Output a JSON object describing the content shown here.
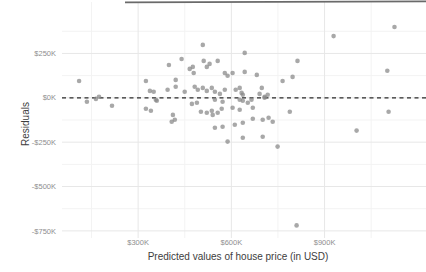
{
  "chart_data": {
    "type": "scatter",
    "title": "",
    "xlabel": "Predicted values of house price (in USD)",
    "ylabel": "Residuals",
    "units": "values in thousands of USD (K)",
    "xlim": [
      55,
      1220
    ],
    "ylim": [
      -790,
      540
    ],
    "grid": true,
    "legend": false,
    "x_ticks": [
      {
        "value": 300,
        "label": "$300K"
      },
      {
        "value": 600,
        "label": "$600K"
      },
      {
        "value": 900,
        "label": "$900K"
      }
    ],
    "y_ticks": [
      {
        "value": 250,
        "label": "$250K"
      },
      {
        "value": 0,
        "label": "$0K"
      },
      {
        "value": -250,
        "label": "-$250K"
      },
      {
        "value": -500,
        "label": "-$500K"
      },
      {
        "value": -750,
        "label": "-$750K"
      }
    ],
    "x_minor_gridlines": [
      150,
      450,
      750,
      1050
    ],
    "y_minor_gridlines": [
      375,
      125,
      -125,
      -375,
      -625
    ],
    "reference_line": {
      "y": 0,
      "style": "dashed"
    },
    "colors": {
      "point": "#878787",
      "grid_major": "#e7e7e7",
      "grid_minor": "#f3f3f3",
      "reference_line": "#2b2b2b",
      "tick_label": "#8e8e8e",
      "axis_title": "#3d3d3d",
      "top_border": "#6a6a6a",
      "background": "#ffffff"
    },
    "points": [
      [
        110,
        95
      ],
      [
        135,
        -22
      ],
      [
        164,
        -6
      ],
      [
        174,
        6
      ],
      [
        216,
        -45
      ],
      [
        325,
        95
      ],
      [
        338,
        39
      ],
      [
        350,
        34
      ],
      [
        360,
        -17
      ],
      [
        325,
        -62
      ],
      [
        341,
        -73
      ],
      [
        357,
        -11
      ],
      [
        395,
        45
      ],
      [
        399,
        185
      ],
      [
        412,
        -96
      ],
      [
        418,
        -124
      ],
      [
        408,
        -135
      ],
      [
        421,
        101
      ],
      [
        421,
        62
      ],
      [
        440,
        219
      ],
      [
        466,
        163
      ],
      [
        476,
        174
      ],
      [
        479,
        140
      ],
      [
        511,
        208
      ],
      [
        521,
        174
      ],
      [
        530,
        191
      ],
      [
        556,
        208
      ],
      [
        508,
        298
      ],
      [
        579,
        140
      ],
      [
        588,
        124
      ],
      [
        604,
        140
      ],
      [
        450,
        34
      ],
      [
        482,
        62
      ],
      [
        492,
        45
      ],
      [
        508,
        56
      ],
      [
        521,
        39
      ],
      [
        537,
        56
      ],
      [
        547,
        34
      ],
      [
        563,
        22
      ],
      [
        579,
        45
      ],
      [
        614,
        45
      ],
      [
        627,
        56
      ],
      [
        633,
        28
      ],
      [
        637,
        17
      ],
      [
        547,
        -11
      ],
      [
        572,
        -22
      ],
      [
        473,
        -34
      ],
      [
        489,
        -28
      ],
      [
        502,
        -79
      ],
      [
        521,
        -84
      ],
      [
        537,
        -73
      ],
      [
        540,
        -96
      ],
      [
        556,
        -84
      ],
      [
        569,
        -62
      ],
      [
        604,
        -56
      ],
      [
        627,
        -67
      ],
      [
        547,
        -169
      ],
      [
        572,
        -163
      ],
      [
        611,
        -152
      ],
      [
        637,
        -140
      ],
      [
        588,
        -247
      ],
      [
        637,
        -225
      ],
      [
        701,
        -219
      ],
      [
        749,
        -275
      ],
      [
        643,
        253
      ],
      [
        643,
        146
      ],
      [
        682,
        129
      ],
      [
        669,
        -56
      ],
      [
        665,
        -11
      ],
      [
        637,
        -17
      ],
      [
        653,
        -28
      ],
      [
        691,
        22
      ],
      [
        707,
        6
      ],
      [
        698,
        56
      ],
      [
        717,
        17
      ],
      [
        707,
        0
      ],
      [
        627,
        -11
      ],
      [
        669,
        -118
      ],
      [
        701,
        -124
      ],
      [
        720,
        -112
      ],
      [
        733,
        -135
      ],
      [
        788,
        -79
      ],
      [
        765,
        95
      ],
      [
        797,
        118
      ],
      [
        813,
        208
      ],
      [
        929,
        348
      ],
      [
        1125,
        399
      ],
      [
        1102,
        152
      ],
      [
        1106,
        -79
      ],
      [
        1003,
        -185
      ],
      [
        810,
        -719
      ]
    ]
  }
}
